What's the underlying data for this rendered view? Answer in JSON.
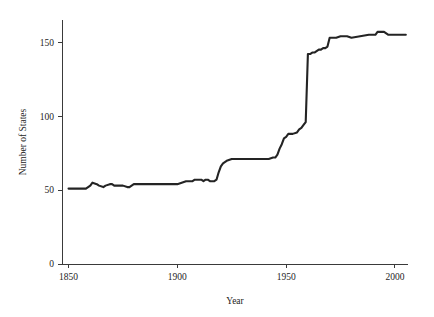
{
  "chart_data": {
    "type": "line",
    "title": "",
    "xlabel": "Year",
    "ylabel": "Number of States",
    "xlim": [
      1847,
      2006
    ],
    "ylim": [
      0,
      165
    ],
    "grid": false,
    "legend": "none",
    "line_color": "#242424",
    "axis_color": "#3a3a3a",
    "background_color": "#ffffff",
    "xticks": [
      1850,
      1900,
      1950,
      2000
    ],
    "xtick_labels": [
      "1850",
      "1900",
      "1950",
      "2000"
    ],
    "yticks": [
      0,
      50,
      100,
      150
    ],
    "ytick_labels": [
      "0",
      "50",
      "100",
      "150"
    ],
    "series": [
      {
        "name": "Number of States",
        "x": [
          1850,
          1854,
          1858,
          1860,
          1861,
          1863,
          1864,
          1866,
          1867,
          1869,
          1870,
          1871,
          1873,
          1875,
          1877,
          1878,
          1880,
          1885,
          1890,
          1895,
          1900,
          1902,
          1904,
          1905,
          1907,
          1908,
          1910,
          1911,
          1912,
          1913,
          1914,
          1915,
          1916,
          1917,
          1918,
          1919,
          1920,
          1921,
          1922,
          1923,
          1925,
          1930,
          1935,
          1940,
          1942,
          1944,
          1945,
          1946,
          1947,
          1948,
          1949,
          1950,
          1951,
          1953,
          1955,
          1956,
          1957,
          1958,
          1959,
          1960,
          1961,
          1962,
          1963,
          1964,
          1965,
          1966,
          1967,
          1968,
          1969,
          1970,
          1971,
          1973,
          1975,
          1978,
          1980,
          1984,
          1988,
          1990,
          1991,
          1992,
          1993,
          1994,
          1995,
          1997,
          1999,
          2000,
          2002,
          2005
        ],
        "y": [
          51,
          51,
          51,
          53,
          55,
          54,
          53,
          52,
          53,
          54,
          54,
          53,
          53,
          53,
          52,
          52,
          54,
          54,
          54,
          54,
          54,
          55,
          56,
          56,
          56,
          57,
          57,
          57,
          56,
          57,
          57,
          56,
          56,
          56,
          57,
          62,
          66,
          68,
          69,
          70,
          71,
          71,
          71,
          71,
          71,
          72,
          72,
          74,
          78,
          81,
          85,
          86,
          88,
          88,
          89,
          91,
          92,
          94,
          96,
          142,
          142,
          143,
          143,
          144,
          145,
          145,
          146,
          146,
          147,
          153,
          153,
          153,
          154,
          154,
          153,
          154,
          155,
          155,
          155,
          157,
          157,
          157,
          157,
          155,
          155,
          155,
          155,
          155
        ]
      }
    ]
  },
  "geometry": {
    "plot_left": 62,
    "plot_right": 408,
    "plot_bottom": 264,
    "plot_top": 20
  }
}
